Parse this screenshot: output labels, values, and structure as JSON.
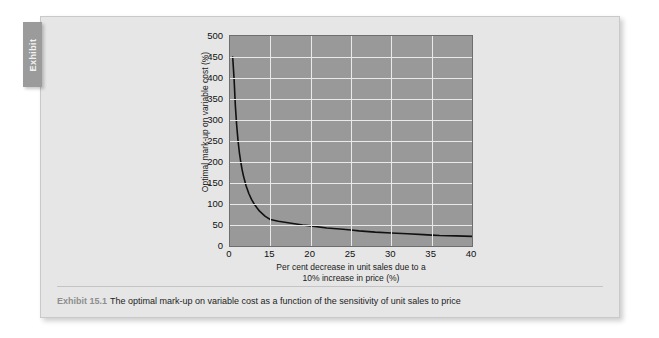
{
  "exhibit_tab": {
    "label": "Exhibit"
  },
  "caption": {
    "label": "Exhibit 15.1",
    "text": "The optimal mark-up on variable cost as a function of the sensitivity of unit sales to price"
  },
  "colors": {
    "panel_background": "#e6e6e6",
    "plot_background": "#999999",
    "gridline": "#e9e9e9",
    "curve": "#111111",
    "tab_background": "#9b9b9b",
    "plot_border": "#6e6e6e"
  },
  "chart_data": {
    "type": "line",
    "title": "",
    "subtitle": "",
    "xlabel": "Per cent decrease in unit sales due to a 10% increase in price (%)",
    "xlabel_lines": [
      "Per cent decrease in unit sales due to a",
      "10% increase in price (%)"
    ],
    "ylabel": "Optimal mark-up on variable cost (%)",
    "xlim": [
      0,
      40
    ],
    "ylim": [
      0,
      500
    ],
    "xticks": [
      0,
      15,
      20,
      25,
      30,
      35,
      40
    ],
    "xtick_labels": [
      "0",
      "15",
      "20",
      "25",
      "30",
      "35",
      "40"
    ],
    "yticks": [
      0,
      50,
      100,
      150,
      200,
      250,
      300,
      350,
      400,
      450,
      500
    ],
    "ytick_labels": [
      "0",
      "50",
      "100",
      "150",
      "200",
      "250",
      "300",
      "350",
      "400",
      "450",
      "500"
    ],
    "grid": true,
    "grid_axis": "both",
    "legend": false,
    "legend_position": "none",
    "series": [
      {
        "name": "Optimal mark-up on variable cost",
        "x": [
          1.0,
          1.5,
          2.0,
          2.5,
          3.0,
          3.5,
          4.0,
          4.5,
          5.0,
          6.0,
          7.0,
          8.0,
          9.0,
          10.0,
          11.0,
          12.0,
          13.0,
          14.0,
          15.0,
          16.0,
          17.0,
          18.0,
          19.0,
          20.0,
          22.0,
          24.0,
          25.0,
          26.0,
          28.0,
          30.0,
          32.0,
          34.0,
          35.0,
          36.0,
          38.0,
          40.0
        ],
        "y": [
          450,
          400,
          333,
          286,
          250,
          222,
          200,
          182,
          167,
          143,
          125,
          111,
          100,
          91,
          83,
          77,
          71,
          67,
          63,
          59,
          56,
          53,
          50,
          48,
          43,
          40,
          38,
          36,
          33,
          31,
          29,
          27,
          26,
          25,
          24,
          23
        ]
      }
    ],
    "annotations": [
      {
        "text": "Curve follows optimal mark-up = 100 x 10 / (elasticity-based unit sales decrease), a hyperbolic decay",
        "visible": false
      }
    ]
  }
}
